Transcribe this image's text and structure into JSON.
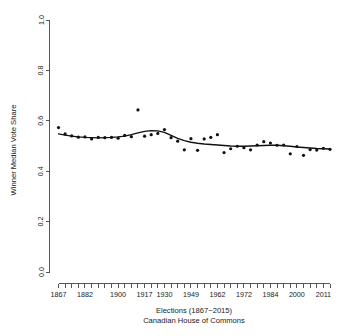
{
  "chart_data": {
    "type": "scatter",
    "title": "",
    "xlabel": "Elections (1867−2015)",
    "xlabel_line2": "Canadian House of Commons",
    "ylabel": "Winner Median Vote Share",
    "xlim": [
      1,
      42
    ],
    "ylim": [
      0.0,
      1.0
    ],
    "grid": false,
    "legend": null,
    "y_ticks": [
      "0.0",
      "0.2",
      "0.4",
      "0.6",
      "0.8",
      "1.0"
    ],
    "y_tick_values": [
      0.0,
      0.2,
      0.4,
      0.6,
      0.8,
      1.0
    ],
    "x_tick_labels": [
      "1867",
      "1882",
      "1900",
      "1917",
      "1930",
      "1949",
      "1962",
      "1972",
      "1984",
      "2000",
      "2011"
    ],
    "x_tick_label_indices": [
      1,
      5,
      10,
      14,
      17,
      21,
      25,
      29,
      33,
      37,
      41
    ],
    "n_ticks": 42,
    "x_election_years": [
      1867,
      1872,
      1874,
      1878,
      1882,
      1887,
      1891,
      1896,
      1900,
      1904,
      1908,
      1911,
      1917,
      1921,
      1925,
      1926,
      1930,
      1935,
      1940,
      1945,
      1949,
      1953,
      1957,
      1958,
      1962,
      1963,
      1965,
      1968,
      1972,
      1974,
      1979,
      1980,
      1984,
      1988,
      1993,
      1997,
      2000,
      2004,
      2006,
      2008,
      2011,
      2015
    ],
    "series": [
      {
        "name": "Winner Median Vote Share",
        "marker": "filled-circle",
        "color": "#111111",
        "values": [
          0.573,
          0.548,
          0.54,
          0.535,
          0.536,
          0.528,
          0.534,
          0.533,
          0.534,
          0.531,
          0.542,
          0.537,
          0.643,
          0.539,
          0.545,
          0.55,
          0.565,
          0.533,
          0.519,
          0.485,
          0.529,
          0.483,
          0.528,
          0.534,
          0.545,
          0.474,
          0.489,
          0.499,
          0.493,
          0.485,
          0.504,
          0.517,
          0.512,
          0.503,
          0.504,
          0.469,
          0.498,
          0.463,
          0.486,
          0.484,
          0.491,
          0.487
        ]
      },
      {
        "name": "loess smooth",
        "marker": "line",
        "color": "#111111",
        "values": [
          0.548,
          0.543,
          0.539,
          0.536,
          0.534,
          0.533,
          0.532,
          0.533,
          0.534,
          0.536,
          0.539,
          0.545,
          0.552,
          0.558,
          0.561,
          0.56,
          0.554,
          0.542,
          0.53,
          0.521,
          0.515,
          0.511,
          0.508,
          0.506,
          0.504,
          0.502,
          0.5,
          0.499,
          0.499,
          0.5,
          0.501,
          0.502,
          0.503,
          0.503,
          0.501,
          0.499,
          0.496,
          0.494,
          0.492,
          0.49,
          0.489,
          0.488
        ]
      }
    ]
  },
  "figure": {
    "background_color": "#ffffff",
    "axis_color": "#555555",
    "point_color": "#111111",
    "line_color": "#111111"
  }
}
